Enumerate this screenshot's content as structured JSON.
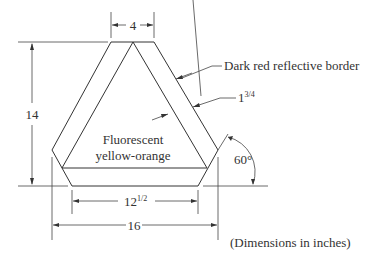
{
  "diagram": {
    "dimensions": {
      "top_width": "4",
      "height": "14",
      "border_width_whole": "1",
      "border_width_frac": "3/4",
      "inner_width_whole": "12",
      "inner_width_frac": "1/2",
      "overall_width": "16",
      "angle": "60°"
    },
    "labels": {
      "border": "Dark red reflective border",
      "center_line1": "Fluorescent",
      "center_line2": "yellow-orange",
      "units_note": "(Dimensions in inches)"
    }
  }
}
